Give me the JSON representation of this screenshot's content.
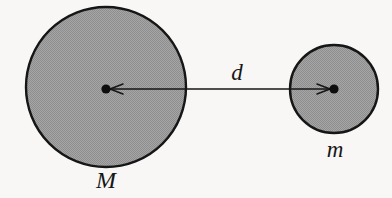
{
  "figure": {
    "background_color": "#f8f7f5",
    "stroke_color": "#161616",
    "fill_color": "#9c9c9c",
    "width": 392,
    "height": 198
  },
  "labels": {
    "large_mass": "M",
    "small_mass": "m",
    "distance": "d"
  },
  "shapes": {
    "large_circle": {
      "name": "M",
      "cx": 106,
      "cy": 87,
      "r": 80,
      "fill": "#9c9c9c",
      "stroke": "#161616",
      "stroke_width": 2.4
    },
    "small_circle": {
      "name": "m",
      "cx": 334,
      "cy": 89,
      "r": 44,
      "fill": "#9c9c9c",
      "stroke": "#161616",
      "stroke_width": 2.4
    },
    "center_dot_large": {
      "cx": 106,
      "cy": 89,
      "r": 4.6,
      "fill": "#0d0d0d"
    },
    "center_dot_small": {
      "cx": 334,
      "cy": 89,
      "r": 4.6,
      "fill": "#0d0d0d"
    },
    "distance_arrow": {
      "x1": 108,
      "x2": 332,
      "y": 89,
      "stroke": "#161616",
      "stroke_width": 1.5,
      "double_headed": true,
      "arrowhead_length": 13,
      "arrowhead_half_width": 5
    }
  },
  "chart_data": {
    "type": "diagram",
    "elements": [
      {
        "id": "M",
        "role": "large-mass",
        "label": "M",
        "center_x": 106,
        "center_y": 87,
        "radius": 80
      },
      {
        "id": "m",
        "role": "small-mass",
        "label": "m",
        "center_x": 334,
        "center_y": 89,
        "radius": 44
      },
      {
        "id": "d",
        "role": "separation",
        "label": "d",
        "from": "M",
        "to": "m",
        "measured_px": 224
      }
    ],
    "annotations": [
      "M",
      "m",
      "d"
    ]
  }
}
